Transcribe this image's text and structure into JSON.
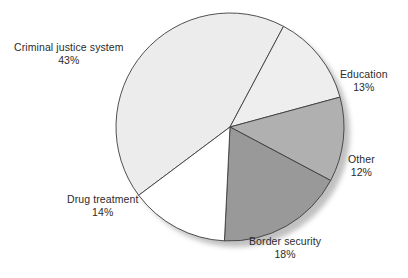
{
  "chart_data": {
    "type": "pie",
    "title": "",
    "subtitle": "",
    "xlabel": "",
    "ylabel": "",
    "legend_position": "none",
    "grid": false,
    "unit": "%",
    "total": 100,
    "categories": [
      "Criminal justice system",
      "Education",
      "Other",
      "Border security",
      "Drug treatment"
    ],
    "values": [
      43,
      13,
      12,
      18,
      14
    ],
    "slices": [
      {
        "label": "Criminal justice system",
        "value": 43,
        "value_text": "43%",
        "color": "#ececec",
        "start_angle": 233.2,
        "end_angle": 388.0
      },
      {
        "label": "Education",
        "value": 13,
        "value_text": "13%",
        "color": "#eeeeee",
        "start_angle": 28.0,
        "end_angle": 74.8
      },
      {
        "label": "Other",
        "value": 12,
        "value_text": "12%",
        "color": "#b0b0b0",
        "start_angle": 74.8,
        "end_angle": 118.0
      },
      {
        "label": "Border security",
        "value": 18,
        "value_text": "18%",
        "color": "#999999",
        "start_angle": 118.0,
        "end_angle": 182.8
      },
      {
        "label": "Drug treatment",
        "value": 14,
        "value_text": "14%",
        "color": "#ffffff",
        "start_angle": 182.8,
        "end_angle": 233.2
      }
    ],
    "geometry": {
      "center_x": 230,
      "center_y": 127,
      "radius": 114,
      "shadow_offset_x": 6,
      "shadow_offset_y": 6,
      "shadow_color": "#bdbdbd",
      "stroke_color": "#3d3d3d",
      "stroke_width": 0.9
    }
  },
  "labels": {
    "criminal_justice_system": {
      "name": "Criminal justice system",
      "value": "43%"
    },
    "education": {
      "name": "Education",
      "value": "13%"
    },
    "other": {
      "name": "Other",
      "value": "12%"
    },
    "border_security": {
      "name": "Border security",
      "value": "18%"
    },
    "drug_treatment": {
      "name": "Drug treatment",
      "value": "14%"
    }
  }
}
